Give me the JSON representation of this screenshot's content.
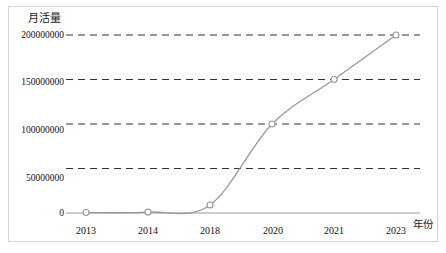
{
  "chart_data": {
    "type": "line",
    "title": "",
    "xlabel": "年份",
    "ylabel": "月活量",
    "x": [
      "2013",
      "2014",
      "2018",
      "2020",
      "2021",
      "2023"
    ],
    "values": [
      500000,
      1000000,
      9000000,
      100000000,
      150000000,
      200000000
    ],
    "series": [
      {
        "name": "月活量",
        "values": [
          500000,
          1000000,
          9000000,
          100000000,
          150000000,
          200000000
        ]
      }
    ],
    "ytick_labels": [
      "0",
      "50000000",
      "100000000",
      "150000000",
      "200000000"
    ],
    "ytick_values": [
      0,
      50000000,
      100000000,
      150000000,
      200000000
    ],
    "ylim": [
      0,
      200000000
    ],
    "grid": "horizontal-dashed",
    "legend": "none",
    "marker": "circle-open",
    "line_color": "#999999",
    "grid_color": "#333333",
    "axis_color": "#808080",
    "frame_color": "#d6d6d6",
    "smoothing": "spline"
  }
}
